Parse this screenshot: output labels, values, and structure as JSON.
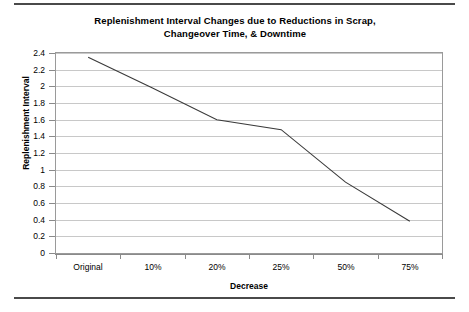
{
  "rules": {
    "top": "divider-top",
    "bottom": "divider-bottom"
  },
  "chart_data": {
    "type": "line",
    "title": "Replenishment Interval Changes due to Reductions in Scrap, Changeover Time, & Downtime",
    "title_line1": "Replenishment Interval Changes due to Reductions in Scrap,",
    "title_line2": "Changeover Time, & Downtime",
    "xlabel": "Decrease",
    "ylabel": "Replenishment Interval",
    "categories": [
      "Original",
      "10%",
      "20%",
      "25%",
      "50%",
      "75%"
    ],
    "values": [
      2.35,
      1.98,
      1.6,
      1.48,
      0.85,
      0.38
    ],
    "series": [
      {
        "name": "Replenishment Interval",
        "values": [
          2.35,
          1.98,
          1.6,
          1.48,
          0.85,
          0.38
        ],
        "color": "#3a3a3a"
      }
    ],
    "ylim": [
      0,
      2.4
    ],
    "ytick_step": 0.2,
    "yticks": [
      "0",
      "0.2",
      "0.4",
      "0.6",
      "0.8",
      "1",
      "1.2",
      "1.4",
      "1.6",
      "1.8",
      "2",
      "2.2",
      "2.4"
    ],
    "grid": true,
    "grid_axis": "y",
    "legend": "none",
    "line_color": "#3a3a3a",
    "plot_border_color": "#9a9a9a",
    "gridline_color": "#c8c8c8"
  }
}
